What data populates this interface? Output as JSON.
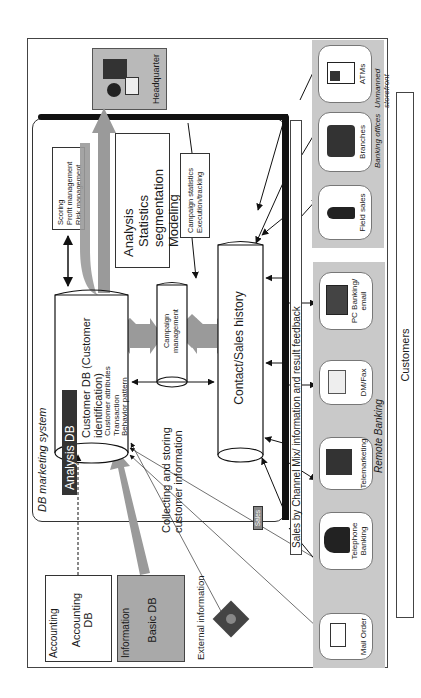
{
  "diagram": {
    "system_label": "DB marketing system",
    "headquarter": {
      "label": "Headquarter",
      "icon": "office-worker-icon"
    },
    "scoring_box": {
      "lines": [
        "Scoring",
        "Profit management",
        "Risk management"
      ]
    },
    "analysis_box": {
      "lines": [
        "Analysis",
        "Statistics segmentation",
        "Modeling"
      ]
    },
    "campaign_stats_box": {
      "lines": [
        "Campaign statistics",
        "Execution/tracking"
      ]
    },
    "analysis_db": {
      "title": "Analysis DB",
      "heading": "Customer DB (Customer identification)",
      "heading_line1": "Customer DB (Customer",
      "heading_line2": "identification)",
      "items": [
        "Customer attributes",
        "Transaction",
        "Behavior pattern"
      ]
    },
    "campaign_management": {
      "line1": "Campaign",
      "line2": "management"
    },
    "contact_sales_history": {
      "label": "Contact/Sales history"
    },
    "collecting_label": {
      "line1": "Collecting and storing",
      "line2": "customer information"
    },
    "sales_tag": {
      "label": "Sales"
    },
    "sales_channel_bar": {
      "label": "Sales by Channel Mix/ information and result feedback"
    },
    "accounting": {
      "group_label": "Accounting",
      "db_line1": "Accounting",
      "db_line2": "DB"
    },
    "information": {
      "group_label": "Information",
      "db_label": "Basic DB"
    },
    "external_information": {
      "label": "External information",
      "icon": "satellite-icon"
    },
    "storefront_channels": {
      "items": [
        {
          "label": "Field sales",
          "icon": "salesperson-icon"
        },
        {
          "label": "Branches",
          "icon": "bank-teller-icon"
        },
        {
          "label": "ATMs",
          "icon": "atm-icon"
        }
      ],
      "captions": [
        "Banking offices",
        "Unmanned storefront"
      ]
    },
    "remote_channels": {
      "caption": "Remote Banking",
      "items": [
        {
          "label": "Mail Order",
          "icon": "envelope-icon"
        },
        {
          "label_line1": "Telephone",
          "label_line2": "Banking",
          "icon": "telephone-operator-icon"
        },
        {
          "label": "Telemarketing",
          "icon": "call-center-icon"
        },
        {
          "label": "DM/Fax",
          "icon": "fax-mail-icon"
        },
        {
          "label_line1": "PC Banking/",
          "label_line2": "email",
          "icon": "computer-icon"
        }
      ]
    },
    "customers": {
      "label": "Customers"
    },
    "colors": {
      "panel_gray": "#c9c9c9",
      "arrow_gray": "#9a9a9a",
      "dark_bar": "#333333",
      "line_black": "#111111"
    }
  }
}
